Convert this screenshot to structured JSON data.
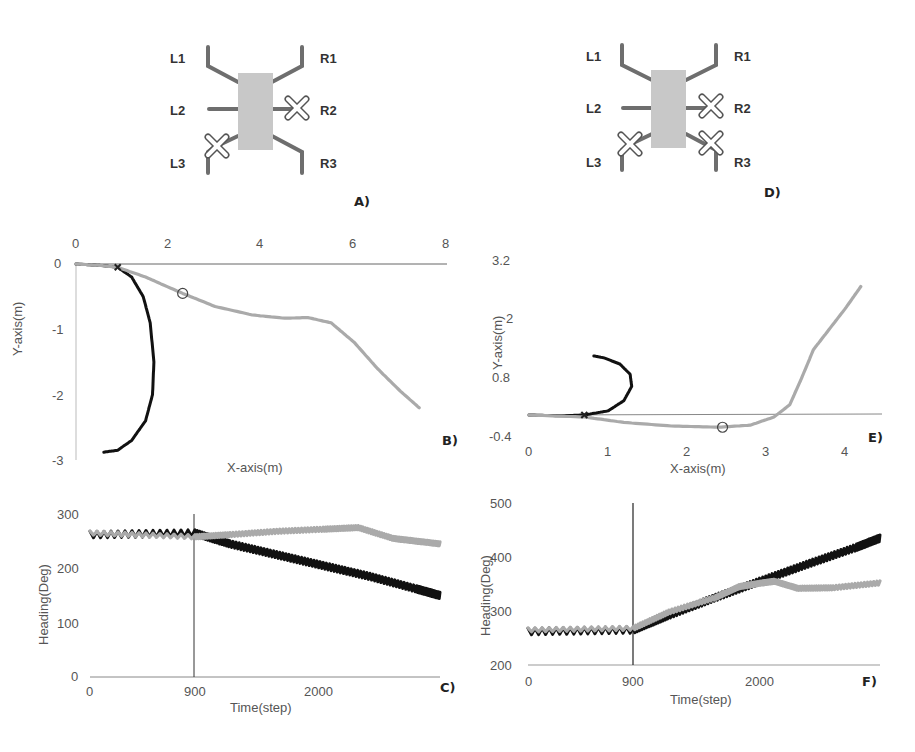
{
  "figure": {
    "panels": {
      "A": {
        "label": "A)",
        "legs": [
          "L1",
          "L2",
          "L3",
          "R1",
          "R2",
          "R3"
        ],
        "failed_legs": [
          "R2",
          "L3"
        ]
      },
      "D": {
        "label": "D)",
        "legs": [
          "L1",
          "L2",
          "L3",
          "R1",
          "R2",
          "R3"
        ],
        "failed_legs": [
          "R2",
          "L3",
          "R3"
        ]
      },
      "B": {
        "label": "B)",
        "xlabel": "X-axis(m)",
        "ylabel": "Y-axis(m)",
        "xticks": [
          "0",
          "2",
          "4",
          "6",
          "8"
        ],
        "yticks": [
          "0",
          "-1",
          "-2",
          "-3"
        ]
      },
      "E": {
        "label": "E)",
        "xlabel": "X-axis(m)",
        "ylabel": "Y-axis(m)",
        "xticks": [
          "0",
          "1",
          "2",
          "3",
          "4"
        ],
        "yticks": [
          "3.2",
          "2",
          "0.8",
          "-0.4"
        ]
      },
      "C": {
        "label": "C)",
        "xlabel": "Time(step)",
        "ylabel": "Heading(Deg)",
        "xticks": [
          "0",
          "900",
          "2000"
        ],
        "yticks": [
          "300",
          "200",
          "100",
          "0"
        ]
      },
      "F": {
        "label": "F)",
        "xlabel": "Time(step)",
        "ylabel": "Heading(Deg)",
        "xticks": [
          "0",
          "900",
          "2000"
        ],
        "yticks": [
          "500",
          "400",
          "300",
          "200"
        ]
      }
    },
    "colors": {
      "adapted": "#aaaaaa",
      "unadapted": "#111111",
      "axis": "#888888",
      "body": "#c8c8c8",
      "leg": "#6e6e6e"
    }
  },
  "chart_data": [
    {
      "panel": "B",
      "type": "line",
      "title": "",
      "xlabel": "X-axis(m)",
      "ylabel": "Y-axis(m)",
      "xlim": [
        0,
        8
      ],
      "ylim": [
        -3,
        0
      ],
      "grid": false,
      "legend": "none",
      "series": [
        {
          "name": "black trajectory (after failure, no adaptation)",
          "color": "#111111",
          "x": [
            0,
            0.5,
            0.9,
            1.2,
            1.45,
            1.6,
            1.68,
            1.65,
            1.5,
            1.2,
            0.9,
            0.6
          ],
          "y": [
            0,
            -0.02,
            -0.05,
            -0.2,
            -0.5,
            -0.9,
            -1.5,
            -2.0,
            -2.4,
            -2.7,
            -2.85,
            -2.88
          ]
        },
        {
          "name": "grey trajectory (adapted)",
          "color": "#aaaaaa",
          "x": [
            0,
            0.5,
            0.9,
            1.5,
            2.3,
            3.0,
            3.8,
            4.5,
            5.0,
            5.5,
            6.0,
            6.5,
            7.0,
            7.4
          ],
          "y": [
            0,
            -0.02,
            -0.05,
            -0.2,
            -0.45,
            -0.65,
            -0.78,
            -0.83,
            -0.82,
            -0.9,
            -1.2,
            -1.6,
            -1.95,
            -2.2
          ]
        }
      ],
      "annotations": [
        {
          "type": "x-marker",
          "x": 0.9,
          "y": -0.05,
          "text": "failure point"
        },
        {
          "type": "circle-marker",
          "x": 2.3,
          "y": -0.45
        }
      ]
    },
    {
      "panel": "E",
      "type": "line",
      "title": "",
      "xlabel": "X-axis(m)",
      "ylabel": "Y-axis(m)",
      "xlim": [
        0,
        4.4
      ],
      "ylim": [
        -0.4,
        3.2
      ],
      "grid": false,
      "legend": "none",
      "series": [
        {
          "name": "black trajectory (after failure, no adaptation)",
          "color": "#111111",
          "x": [
            0,
            0.4,
            0.7,
            1.0,
            1.2,
            1.3,
            1.28,
            1.15,
            0.95,
            0.82
          ],
          "y": [
            0,
            -0.02,
            0,
            0.1,
            0.35,
            0.7,
            1.0,
            1.25,
            1.4,
            1.45
          ]
        },
        {
          "name": "grey trajectory (adapted)",
          "color": "#aaaaaa",
          "x": [
            0,
            0.7,
            1.2,
            1.8,
            2.4,
            2.8,
            3.1,
            3.3,
            3.45,
            3.6,
            3.8,
            4.0,
            4.2
          ],
          "y": [
            0,
            -0.05,
            -0.18,
            -0.27,
            -0.3,
            -0.25,
            -0.05,
            0.25,
            0.9,
            1.6,
            2.1,
            2.6,
            3.15
          ]
        }
      ],
      "annotations": [
        {
          "type": "x-marker",
          "x": 0.7,
          "y": 0,
          "text": "failure point"
        },
        {
          "type": "circle-marker",
          "x": 2.45,
          "y": -0.3
        }
      ]
    },
    {
      "panel": "C",
      "type": "line",
      "title": "",
      "xlabel": "Time(step)",
      "ylabel": "Heading(Deg)",
      "xlim": [
        0,
        3000
      ],
      "ylim": [
        0,
        300
      ],
      "grid": false,
      "legend": "none",
      "series": [
        {
          "name": "black heading (no adaptation)",
          "color": "#111111",
          "x": [
            0,
            900,
            1200,
            1600,
            2000,
            2400,
            2800,
            3000
          ],
          "y": [
            262,
            265,
            245,
            225,
            205,
            185,
            162,
            150
          ]
        },
        {
          "name": "grey heading (adapted)",
          "color": "#aaaaaa",
          "x": [
            0,
            900,
            1200,
            1600,
            2000,
            2300,
            2600,
            2800,
            3000
          ],
          "y": [
            265,
            258,
            262,
            268,
            272,
            275,
            255,
            250,
            245
          ]
        }
      ],
      "annotations": [
        {
          "type": "vline",
          "x": 900,
          "text": "failure time"
        }
      ]
    },
    {
      "panel": "F",
      "type": "line",
      "title": "",
      "xlabel": "Time(step)",
      "ylabel": "Heading(Deg)",
      "xlim": [
        0,
        3000
      ],
      "ylim": [
        200,
        500
      ],
      "grid": false,
      "legend": "none",
      "series": [
        {
          "name": "black heading (no adaptation)",
          "color": "#111111",
          "x": [
            0,
            900,
            1200,
            1600,
            2000,
            2400,
            2800,
            3000
          ],
          "y": [
            262,
            265,
            292,
            325,
            357,
            388,
            418,
            435
          ]
        },
        {
          "name": "grey heading (adapted)",
          "color": "#aaaaaa",
          "x": [
            0,
            900,
            1200,
            1600,
            1800,
            2000,
            2100,
            2300,
            2600,
            3000
          ],
          "y": [
            265,
            268,
            298,
            325,
            345,
            352,
            355,
            342,
            343,
            352
          ]
        }
      ],
      "annotations": [
        {
          "type": "vline",
          "x": 900,
          "text": "failure time"
        }
      ]
    }
  ]
}
